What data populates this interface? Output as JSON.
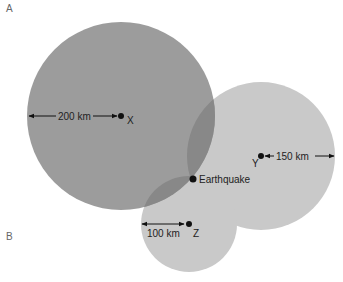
{
  "panel_labels": {
    "a": "A",
    "b": "B"
  },
  "stations": [
    {
      "name": "X",
      "distance_label": "200 km",
      "cx": 121,
      "cy": 116,
      "r": 94
    },
    {
      "name": "Y",
      "distance_label": "150 km",
      "cx": 261,
      "cy": 156,
      "r": 74
    },
    {
      "name": "Z",
      "distance_label": "100 km",
      "cx": 189,
      "cy": 224,
      "r": 48
    }
  ],
  "epicenter": {
    "label": "Earthquake",
    "x": 193,
    "y": 179
  },
  "colors": {
    "circle_x": "#9c9c9c",
    "circle_yz": "#c9c9c9",
    "overlap": "#888888",
    "dot": "#111111"
  }
}
